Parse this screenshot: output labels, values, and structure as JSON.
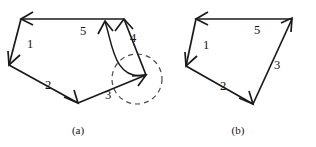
{
  "figure": {
    "background_color": "#ffffff",
    "stroke_color": "#1a1a1a",
    "dashed_color": "#4a4a4a",
    "panels": [
      {
        "id": "panel-a",
        "caption": "(a)",
        "caption_x": 78,
        "caption_y": 131,
        "shape": "pentagon",
        "description": "closed five-sided polygon with directed edges, a curved feedback arrow and a dashed circle highlight",
        "vertices": [
          {
            "name": "top-left",
            "x": 21,
            "y": 19
          },
          {
            "name": "left",
            "x": 9,
            "y": 65
          },
          {
            "name": "bottom",
            "x": 78,
            "y": 103
          },
          {
            "name": "right",
            "x": 146,
            "y": 75
          },
          {
            "name": "top-right",
            "x": 124,
            "y": 19
          }
        ],
        "edges": [
          {
            "label": "1",
            "from": "top-left",
            "to": "left",
            "label_x": 30,
            "label_y": 45
          },
          {
            "label": "2",
            "from": "left",
            "to": "bottom",
            "label_x": 48,
            "label_y": 86
          },
          {
            "label": "3",
            "from": "bottom",
            "to": "right",
            "label_x": 108,
            "label_y": 96
          },
          {
            "label": "4",
            "from": "right",
            "to": "top-right",
            "label_x": 133,
            "label_y": 39
          },
          {
            "label": "5",
            "from": "top-right",
            "to": "top-left",
            "label_x": 83,
            "label_y": 32
          }
        ],
        "curve": {
          "name": "feedback-curve-arrow",
          "start_x": 146,
          "start_y": 75,
          "end_x": 105,
          "end_y": 22,
          "control1_x": 113,
          "control1_y": 82,
          "control2_x": 112,
          "control2_y": 40
        },
        "circle": {
          "name": "dashed-highlight-circle",
          "cx": 137,
          "cy": 79,
          "r": 25
        }
      },
      {
        "id": "panel-b",
        "caption": "(b)",
        "caption_x": 238,
        "caption_y": 131,
        "shape": "quadrilateral",
        "description": "closed four-sided polygon with directed edges after simplification",
        "vertices": [
          {
            "name": "top-left",
            "x": 196,
            "y": 19
          },
          {
            "name": "left",
            "x": 186,
            "y": 66
          },
          {
            "name": "bottom",
            "x": 253,
            "y": 104
          },
          {
            "name": "top-right",
            "x": 292,
            "y": 19
          }
        ],
        "edges": [
          {
            "label": "1",
            "from": "top-left",
            "to": "left",
            "label_x": 206,
            "label_y": 46
          },
          {
            "label": "2",
            "from": "left",
            "to": "bottom",
            "label_x": 223,
            "label_y": 87
          },
          {
            "label": "3",
            "from": "bottom",
            "to": "top-right",
            "label_x": 277,
            "label_y": 66
          },
          {
            "label": "5",
            "from": "top-right",
            "to": "top-left",
            "label_x": 257,
            "label_y": 31
          }
        ]
      }
    ]
  }
}
